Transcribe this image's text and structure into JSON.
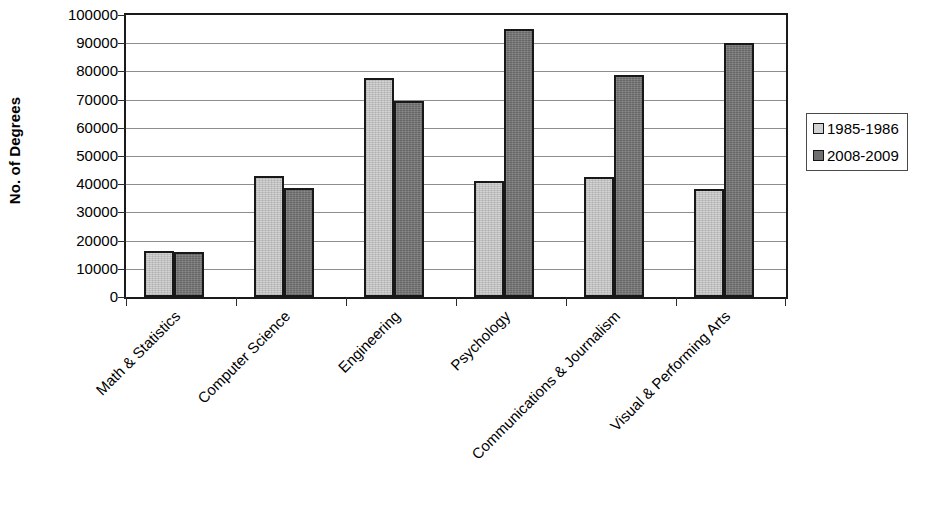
{
  "chart_data": {
    "type": "bar",
    "title": "",
    "xlabel": "",
    "ylabel": "No. of Degrees",
    "ylim": [
      0,
      100000
    ],
    "ytick_step": 10000,
    "yticks": [
      0,
      10000,
      20000,
      30000,
      40000,
      50000,
      60000,
      70000,
      80000,
      90000,
      100000
    ],
    "ytick_labels": [
      "0",
      "10000",
      "20000",
      "30000",
      "40000",
      "50000",
      "60000",
      "70000",
      "80000",
      "90000",
      "100000"
    ],
    "grid": true,
    "grid_axis": "y",
    "legend_position": "right",
    "categories": [
      "Math & Statistics",
      "Computer Science",
      "Engineering",
      "Psychology",
      "Communications & Journalism",
      "Visual & Performing Arts"
    ],
    "series": [
      {
        "name": "1985-1986",
        "color": "#d2d2d2",
        "values": [
          16300,
          43000,
          77800,
          41200,
          42500,
          38400
        ]
      },
      {
        "name": "2008-2009",
        "color": "#797979",
        "values": [
          15800,
          38600,
          69600,
          95000,
          78600,
          90000
        ]
      }
    ]
  },
  "axes": {
    "y_title": "No. of Degrees"
  },
  "legend": {
    "items": [
      {
        "label": "1985-1986"
      },
      {
        "label": "2008-2009"
      }
    ]
  },
  "colors": {
    "series_1985": "#d2d2d2",
    "series_2008": "#797979",
    "axis": "#1a1a1a",
    "gridline": "#8e8e8e",
    "background": "#ffffff"
  }
}
